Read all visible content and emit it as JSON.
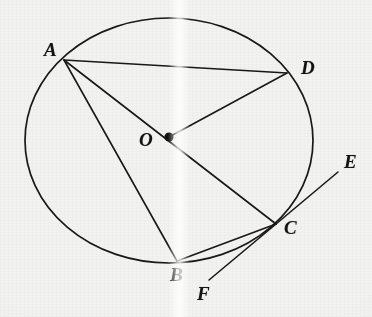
{
  "figure": {
    "kind": "euclidean-geometry-diagram",
    "canvas": {
      "width": 372,
      "height": 317
    },
    "background_color": "#f2f2f1",
    "ink_color": "#1a1814"
  },
  "circle": {
    "name": "circle-O",
    "center_label": "O",
    "center": {
      "x": 169,
      "y": 140.5
    },
    "radius_x": 144,
    "radius_y": 122.5,
    "stroke_width": 1.7
  },
  "points": [
    {
      "id": "A",
      "label": "A",
      "x": 64,
      "y": 60,
      "label_x": 44,
      "label_y": 40,
      "marked": false
    },
    {
      "id": "D",
      "label": "D",
      "x": 287,
      "y": 73,
      "label_x": 301,
      "label_y": 58,
      "marked": false
    },
    {
      "id": "O",
      "label": "O",
      "x": 169,
      "y": 137,
      "label_x": 139,
      "label_y": 130,
      "marked": true
    },
    {
      "id": "C",
      "label": "C",
      "x": 276,
      "y": 224,
      "label_x": 284,
      "label_y": 218,
      "marked": false
    },
    {
      "id": "B",
      "label": "B",
      "x": 177,
      "y": 261,
      "label_x": 170,
      "label_y": 265,
      "marked": false
    },
    {
      "id": "E",
      "label": "E",
      "x": 338,
      "y": 172,
      "label_x": 344,
      "label_y": 152,
      "marked": false
    },
    {
      "id": "F",
      "label": "F",
      "x": 209,
      "y": 280,
      "label_x": 197,
      "label_y": 284,
      "marked": false
    }
  ],
  "segments": [
    {
      "id": "AD",
      "name": "chord-a-d",
      "from": "A",
      "to": "D",
      "kind": "chord"
    },
    {
      "id": "AC",
      "name": "diameter-a-o-c",
      "from": "A",
      "to": "C",
      "kind": "diameter",
      "through": "O"
    },
    {
      "id": "AB",
      "name": "chord-a-b",
      "from": "A",
      "to": "B",
      "kind": "chord"
    },
    {
      "id": "OD",
      "name": "radius-o-d",
      "from": "O",
      "to": "D",
      "kind": "radius"
    },
    {
      "id": "BC",
      "name": "chord-b-c",
      "from": "B",
      "to": "C",
      "kind": "chord"
    },
    {
      "id": "CE",
      "name": "tangent-ray-c-e",
      "from": "C",
      "to": "E",
      "kind": "tangent-ray"
    },
    {
      "id": "CF",
      "name": "tangent-ray-c-f",
      "from": "C",
      "to": "F",
      "kind": "tangent-ray"
    }
  ],
  "center_dot": {
    "name": "center-point-marker",
    "radius": 4.6,
    "color": "#141210"
  }
}
